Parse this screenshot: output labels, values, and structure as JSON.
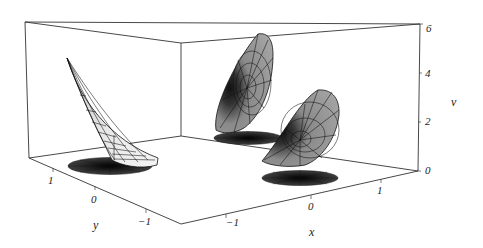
{
  "figure": {
    "type": "3d-surface-plot",
    "axes": {
      "x": {
        "label": "x",
        "ticks": [
          "-1",
          "0",
          "1"
        ]
      },
      "y": {
        "label": "y",
        "ticks": [
          "1",
          "0",
          "-1"
        ]
      },
      "v": {
        "label": "v",
        "ticks": [
          "0",
          "2",
          "4",
          "6"
        ]
      }
    },
    "surfaces": [
      {
        "name": "left-surface",
        "shape": "curved horn-like sheet rising steeply",
        "fill": "#e8e8e8"
      },
      {
        "name": "middle-surface",
        "shape": "cone-like fan with dark center",
        "fill": "#9a9a9a"
      },
      {
        "name": "right-surface",
        "shape": "cone-like fan with dark center",
        "fill": "#9a9a9a"
      }
    ],
    "shadows": [
      {
        "name": "left-shadow",
        "fill": "#2a2a2a"
      },
      {
        "name": "middle-shadow",
        "fill": "#2a2a2a"
      },
      {
        "name": "right-shadow",
        "fill": "#2a2a2a"
      }
    ],
    "colors": {
      "background": "#ffffff",
      "box_line": "#333333",
      "surface_light": "#e8e8e8",
      "surface_mid": "#9a9a9a",
      "shadow": "#2a2a2a"
    }
  }
}
